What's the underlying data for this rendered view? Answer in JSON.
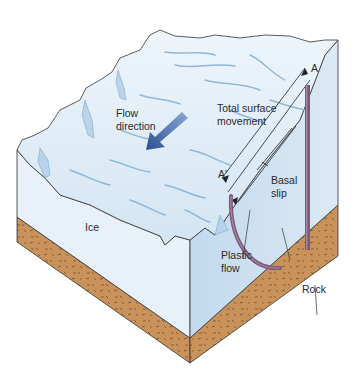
{
  "labels": {
    "flow_direction": [
      "Flow",
      "direction"
    ],
    "total_surface_movement": [
      "Total surface",
      "movement"
    ],
    "point_a": "A",
    "point_a_prime": "A'",
    "basal_slip": [
      "Basal",
      "slip"
    ],
    "plastic_flow": [
      "Plastic",
      "flow"
    ],
    "ice": "Ice",
    "rock": "Rock"
  },
  "colors": {
    "ice_top": "#dbeaf5",
    "ice_left_face": "#e6f0f8",
    "ice_right_face": "#c9def0",
    "crevasse": "#8fb6d6",
    "rock": "#c8925a",
    "rock_dark": "#7a5230",
    "flow_arrow": "#3a5fa0",
    "pole": "#7d5a7a",
    "outline": "#333333"
  }
}
